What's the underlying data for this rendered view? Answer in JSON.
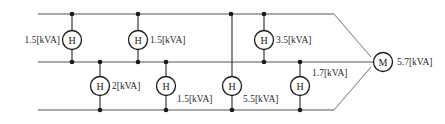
{
  "diagram": {
    "type": "electrical-single-line-diagram",
    "unit": "[kVA]",
    "canvas": {
      "width": 445,
      "height": 124
    },
    "colors": {
      "bus": "#8c8c8c",
      "stub": "#3a3a3a",
      "node_stroke": "#1a1a1a",
      "node_fill": "#ffffff",
      "text": "#2b2b2b",
      "background": "#ffffff"
    },
    "buses": [
      {
        "name": "top-bus",
        "y": 14,
        "x_start": 38,
        "x_end": 334
      },
      {
        "name": "middle-bus",
        "y": 62,
        "x_start": 38,
        "x_end": 374
      },
      {
        "name": "bottom-bus",
        "y": 110,
        "x_start": 38,
        "x_end": 334
      }
    ],
    "tapers": [
      {
        "name": "top-taper",
        "from_x": 334,
        "from_y": 14,
        "to_x": 371,
        "to_y": 57
      },
      {
        "name": "bottom-taper",
        "from_x": 334,
        "from_y": 110,
        "to_x": 371,
        "to_y": 67
      }
    ],
    "main_node": {
      "id": "M",
      "letter": "M",
      "label": "5.7[kVA]",
      "value": 5.7,
      "cx": 383,
      "cy": 62,
      "r": 9.5,
      "label_x": 397,
      "label_y": 62,
      "label_anchor": "start"
    },
    "nodes": [
      {
        "id": "h-top-1",
        "letter": "H",
        "label": "1.5[kVA]",
        "value": 1.5,
        "cx": 72,
        "cy": 40,
        "r": 9.5,
        "bus": "top",
        "stub_from_y": 14,
        "stub_to_y": 62,
        "dot_y": 14,
        "label_x": 60,
        "label_y": 40,
        "label_anchor": "end"
      },
      {
        "id": "h-top-2",
        "letter": "H",
        "label": "1.5[kVA]",
        "value": 1.5,
        "cx": 138,
        "cy": 40,
        "r": 9.5,
        "bus": "top",
        "stub_from_y": 14,
        "stub_to_y": 62,
        "dot_y": 14,
        "label_x": 150,
        "label_y": 40,
        "label_anchor": "start"
      },
      {
        "id": "h-top-3",
        "letter": "H",
        "label": "3.5[kVA]",
        "value": 3.5,
        "cx": 264,
        "cy": 40,
        "r": 9.5,
        "bus": "top",
        "stub_from_y": 14,
        "stub_to_y": 62,
        "dot_y": 14,
        "label_x": 276,
        "label_y": 40,
        "label_anchor": "start"
      },
      {
        "id": "h-bot-1",
        "letter": "H",
        "label": "2[kVA]",
        "value": 2,
        "cx": 100,
        "cy": 86,
        "r": 9.5,
        "bus": "bottom",
        "stub_from_y": 62,
        "stub_to_y": 110,
        "dot_y": 110,
        "label_x": 112,
        "label_y": 86,
        "label_anchor": "start"
      },
      {
        "id": "h-bot-2",
        "letter": "H",
        "label": "1.5[kVA]",
        "value": 1.5,
        "cx": 166,
        "cy": 86,
        "r": 9.5,
        "bus": "bottom",
        "stub_from_y": 62,
        "stub_to_y": 110,
        "dot_y": 110,
        "label_x": 177,
        "label_y": 99,
        "label_anchor": "start"
      },
      {
        "id": "h-bot-3",
        "letter": "H",
        "label": "5.5[kVA]",
        "value": 5.5,
        "cx": 232,
        "cy": 86,
        "r": 9.5,
        "bus": "bottom",
        "stub_from_y": 14,
        "stub_to_y": 110,
        "dot_y": 110,
        "label_x": 243,
        "label_y": 99,
        "label_anchor": "start"
      },
      {
        "id": "h-bot-4",
        "letter": "H",
        "label": "1.7[kVA]",
        "value": 1.7,
        "cx": 300,
        "cy": 86,
        "r": 9.5,
        "bus": "bottom",
        "stub_from_y": 62,
        "stub_to_y": 110,
        "dot_y": 110,
        "label_x": 312,
        "label_y": 73,
        "label_anchor": "start"
      }
    ],
    "junction_dots": [
      {
        "name": "dot-top-1",
        "x": 72,
        "y": 14
      },
      {
        "name": "dot-top-2",
        "x": 138,
        "y": 14
      },
      {
        "name": "dot-top-3",
        "x": 231,
        "y": 14
      },
      {
        "name": "dot-top-4",
        "x": 264,
        "y": 14
      },
      {
        "name": "dot-mid-1",
        "x": 72,
        "y": 62
      },
      {
        "name": "dot-mid-2",
        "x": 100,
        "y": 62
      },
      {
        "name": "dot-mid-3",
        "x": 138,
        "y": 62
      },
      {
        "name": "dot-mid-4",
        "x": 166,
        "y": 62
      },
      {
        "name": "dot-mid-5",
        "x": 264,
        "y": 62
      },
      {
        "name": "dot-mid-6",
        "x": 300,
        "y": 62
      },
      {
        "name": "dot-bot-1",
        "x": 100,
        "y": 110
      },
      {
        "name": "dot-bot-2",
        "x": 166,
        "y": 110
      },
      {
        "name": "dot-bot-3",
        "x": 232,
        "y": 110
      },
      {
        "name": "dot-bot-4",
        "x": 300,
        "y": 110
      }
    ]
  }
}
